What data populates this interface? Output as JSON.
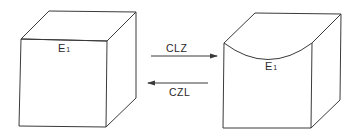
{
  "diagram": {
    "left_cube": {
      "label_main": "E",
      "label_sub": "1",
      "top_face": "flat"
    },
    "right_cube": {
      "label_main": "E",
      "label_sub": "1",
      "top_face": "curved"
    },
    "arrows": [
      {
        "label": "CLZ",
        "direction": "right"
      },
      {
        "label": "CZL",
        "direction": "left"
      }
    ],
    "colors": {
      "stroke": "#3a3a3a",
      "background": "#ffffff"
    }
  }
}
